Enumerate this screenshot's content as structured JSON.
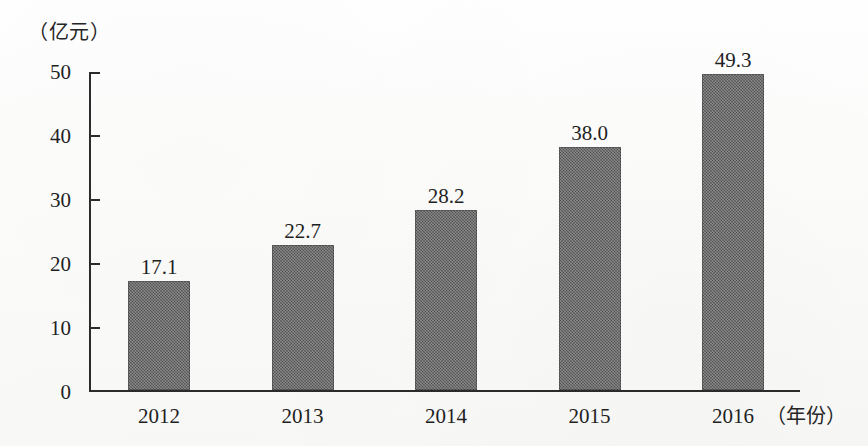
{
  "chart_data": {
    "type": "bar",
    "title": "",
    "subtitle": "",
    "categories": [
      "2012",
      "2013",
      "2014",
      "2015",
      "2016"
    ],
    "values": [
      17.1,
      22.7,
      28.2,
      38.0,
      49.3
    ],
    "value_labels": [
      "17.1",
      "22.7",
      "28.2",
      "38.0",
      "49.3"
    ],
    "xlabel": "（年份）",
    "ylabel": "（亿元）",
    "ylim": [
      0,
      50
    ],
    "ytick_labels": [
      "50",
      "40",
      "30",
      "20",
      "10",
      "0"
    ],
    "ytick_values": [
      50,
      40,
      30,
      20,
      10,
      0
    ],
    "grid": false,
    "legend": null,
    "bar_color": "#5b5b5b",
    "axis_color": "#2b2b2b",
    "background_color": "#fbfbfa"
  },
  "axes": {
    "y_unit_caption": "（亿元）",
    "x_unit_caption": "（年份）"
  }
}
